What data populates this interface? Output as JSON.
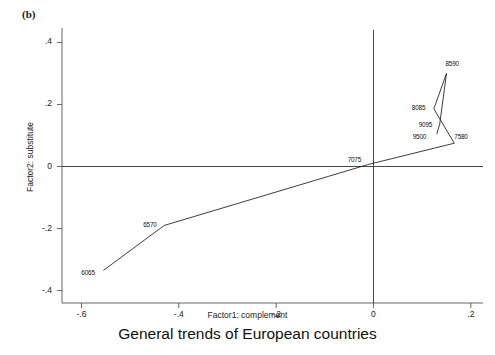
{
  "panel": {
    "label": "(b)"
  },
  "chart_data": {
    "type": "line",
    "title": "General trends of European countries",
    "xlabel": "Factor1: complement",
    "ylabel": "Factor2: substitute",
    "xlim": [
      -0.64,
      0.225
    ],
    "ylim": [
      -0.44,
      0.44
    ],
    "xticks": [
      -0.6,
      -0.4,
      -0.2,
      0,
      0.2
    ],
    "xticklabels": [
      "-.6",
      "-.4",
      "-.2",
      "0",
      ".2"
    ],
    "yticks": [
      -0.4,
      -0.2,
      0,
      0.2,
      0.4
    ],
    "yticklabels": [
      "-.4",
      "-.2",
      "0",
      ".2",
      ".4"
    ],
    "grid": false,
    "legend": null,
    "series": [
      {
        "name": "European countries trend path",
        "points": [
          {
            "label": "6065",
            "x": -0.555,
            "y": -0.335,
            "label_dx": -22,
            "label_dy": 3
          },
          {
            "label": "6570",
            "x": -0.43,
            "y": -0.19,
            "label_dx": -21,
            "label_dy": 0
          },
          {
            "label": "7075",
            "x": -0.012,
            "y": 0.006,
            "label_dx": -20,
            "label_dy": -5
          },
          {
            "label": "7580",
            "x": 0.166,
            "y": 0.075,
            "label_dx": 0,
            "label_dy": -6
          },
          {
            "label": "8085",
            "x": 0.124,
            "y": 0.186,
            "label_dx": -22,
            "label_dy": -1
          },
          {
            "label": "8590",
            "x": 0.15,
            "y": 0.3,
            "label_dx": -1,
            "label_dy": -9
          },
          {
            "label": "9095",
            "x": 0.136,
            "y": 0.136,
            "label_dx": -21,
            "label_dy": 1
          },
          {
            "label": "9500",
            "x": 0.13,
            "y": 0.104,
            "label_dx": -24,
            "label_dy": 3
          }
        ]
      }
    ]
  }
}
